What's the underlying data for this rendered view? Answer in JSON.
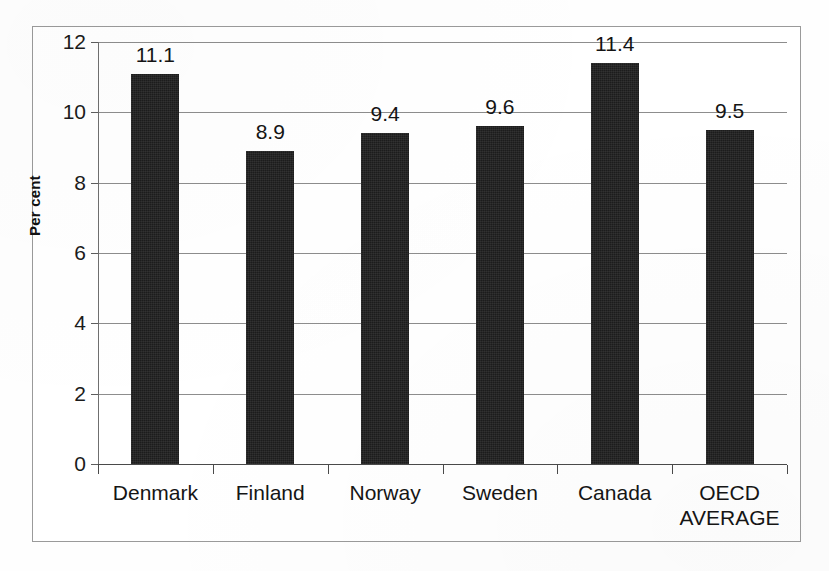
{
  "chart_data": {
    "type": "bar",
    "title": "",
    "subtitle": "",
    "xlabel": "",
    "ylabel": "Per cent",
    "categories": [
      "Denmark",
      "Finland",
      "Norway",
      "Sweden",
      "Canada",
      "OECD\nAVERAGE"
    ],
    "values": [
      11.1,
      8.9,
      9.4,
      9.6,
      11.4,
      9.5
    ],
    "data_labels": [
      "11.1",
      "8.9",
      "9.4",
      "9.6",
      "11.4",
      "9.5"
    ],
    "ylim": [
      0,
      12
    ],
    "ytick_labels": [
      "0",
      "2",
      "4",
      "6",
      "8",
      "10",
      "12"
    ],
    "ytick_values": [
      0,
      2,
      4,
      6,
      8,
      10,
      12
    ],
    "grid": true,
    "legend": false,
    "legend_position": "none",
    "bar_color": "#1c1c1c",
    "gridline_color": "#8d8d8d",
    "axis_color": "#4a4a4a",
    "frame_color": "#9a9a9a",
    "background_color": "#ffffff"
  }
}
